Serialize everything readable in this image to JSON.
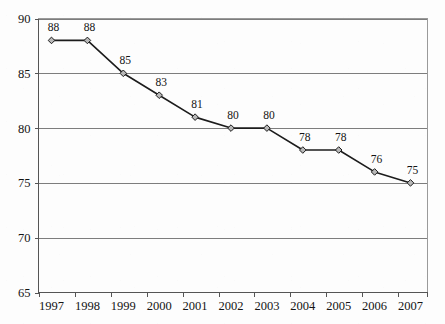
{
  "document": {
    "cut_off_caption_fragment": "",
    "background_color": "#fdfdfd",
    "ink_color": "#1c1c1c",
    "gridline_color": "#7d7d7d",
    "marker_fill_color": "#b8b8b8"
  },
  "chart_data": {
    "type": "line",
    "title": "",
    "subtitle": "",
    "xlabel": "",
    "ylabel": "",
    "categories": [
      "1997",
      "1998",
      "1999",
      "2000",
      "2001",
      "2002",
      "2003",
      "2004",
      "2005",
      "2006",
      "2007"
    ],
    "values": [
      88,
      88,
      85,
      83,
      81,
      80,
      80,
      78,
      78,
      76,
      75
    ],
    "point_labels": [
      "88",
      "88",
      "85",
      "83",
      "81",
      "80",
      "80",
      "78",
      "78",
      "76",
      "75"
    ],
    "ylim": [
      65,
      90
    ],
    "yticks": [
      65,
      70,
      75,
      80,
      85,
      90
    ],
    "ytick_labels": [
      "65",
      "70",
      "75",
      "80",
      "85",
      "90"
    ],
    "grid": true,
    "grid_axis": "y",
    "legend": false,
    "legend_position": "none",
    "marker": "diamond",
    "series": [
      {
        "name": "",
        "values": [
          88,
          88,
          85,
          83,
          81,
          80,
          80,
          78,
          78,
          76,
          75
        ]
      }
    ]
  }
}
